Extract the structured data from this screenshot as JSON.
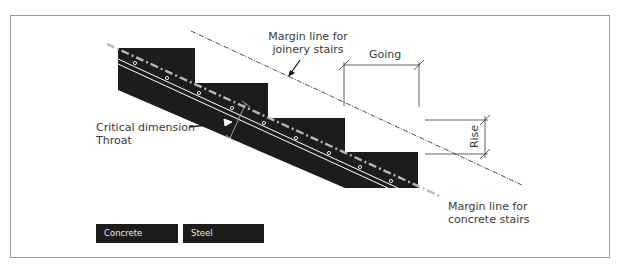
{
  "diagram": {
    "labels": {
      "joinery_margin_line_1": "Margin line for",
      "joinery_margin_line_2": "joinery stairs",
      "going": "Going",
      "rise": "Rise",
      "critical_dimension": "Critical dimension",
      "throat": "Throat",
      "concrete_margin_line_1": "Margin line for",
      "concrete_margin_line_2": "concrete stairs"
    },
    "legend": [
      {
        "label": "Concrete",
        "color": "#1c1c1c"
      },
      {
        "label": "Steel",
        "color": "#1c1c1c"
      }
    ],
    "colors": {
      "stair_fill": "#1c1c1c",
      "line": "#3a3a3a",
      "frame": "#9a9a9a",
      "concrete_margin_line": "#b8b8b8",
      "reinforcement": "#ffffff"
    }
  }
}
